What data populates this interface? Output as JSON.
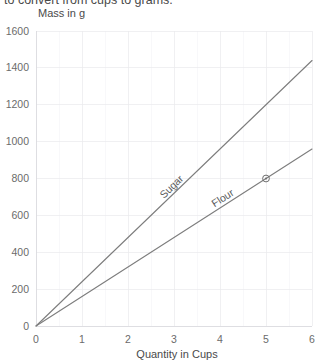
{
  "intro_text": "to convert from cups to grams.",
  "chart_data": {
    "type": "line",
    "title": "",
    "xlabel": "Quantity in Cups",
    "ylabel": "Mass in g",
    "xlim": [
      0,
      6
    ],
    "ylim": [
      0,
      1600
    ],
    "xticks": [
      "0",
      "1",
      "2",
      "3",
      "4",
      "5",
      "6"
    ],
    "xtick_values": [
      0,
      1,
      2,
      3,
      4,
      5,
      6
    ],
    "yticks": [
      "0",
      "200",
      "400",
      "600",
      "800",
      "1000",
      "1200",
      "1400",
      "1600"
    ],
    "ytick_values": [
      0,
      200,
      400,
      600,
      800,
      1000,
      1200,
      1400,
      1600
    ],
    "grid": true,
    "legend": "inline-labels",
    "series": [
      {
        "name": "Sugar",
        "label": "Sugar",
        "x": [
          0,
          6
        ],
        "values": [
          0,
          1440
        ],
        "rate_grams_per_cup": 240,
        "color": "#7d7d7d",
        "label_x": 3.0,
        "label_y": 720
      },
      {
        "name": "Flour",
        "label": "Flour",
        "x": [
          0,
          6
        ],
        "values": [
          0,
          960
        ],
        "rate_grams_per_cup": 160,
        "color": "#7d7d7d",
        "label_x": 4.1,
        "label_y": 656
      }
    ],
    "annotations": [
      {
        "name": "flour-point-marker",
        "series": "Flour",
        "x": 5,
        "y": 800,
        "marker": "circle"
      }
    ]
  },
  "axis_titles": {
    "x": "Quantity in Cups",
    "y": "Mass in g"
  }
}
